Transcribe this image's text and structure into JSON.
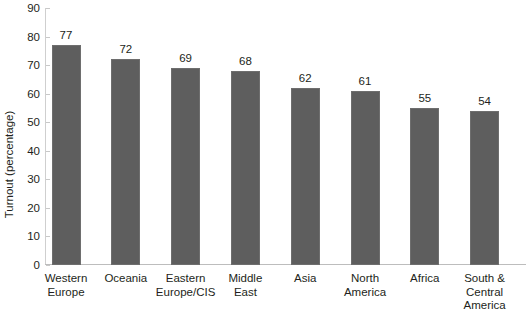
{
  "chart_data": {
    "type": "bar",
    "title": "",
    "xlabel": "",
    "ylabel": "Turnout (percentage)",
    "ylim": [
      0,
      90
    ],
    "ytick_step": 10,
    "yticks": [
      0,
      10,
      20,
      30,
      40,
      50,
      60,
      70,
      80,
      90
    ],
    "grid": false,
    "legend": "none",
    "orientation": "vertical",
    "bar_color": "#5e5e5e",
    "text_color": "#231f20",
    "axis_color": "#c8c8c8",
    "categories": [
      "Western Europe",
      "Oceania",
      "Eastern Europe/CIS",
      "Middle East",
      "Asia",
      "North America",
      "Africa",
      "South & Central America"
    ],
    "category_lines": [
      [
        "Western",
        "Europe"
      ],
      [
        "Oceania"
      ],
      [
        "Eastern",
        "Europe/CIS"
      ],
      [
        "Middle East"
      ],
      [
        "Asia"
      ],
      [
        "North",
        "America"
      ],
      [
        "Africa"
      ],
      [
        "South &",
        "Central",
        "America"
      ]
    ],
    "values": [
      77,
      72,
      69,
      68,
      62,
      61,
      55,
      54
    ],
    "value_labels": [
      "77",
      "72",
      "69",
      "68",
      "62",
      "61",
      "55",
      "54"
    ],
    "ytick_labels": [
      "0",
      "10",
      "20",
      "30",
      "40",
      "50",
      "60",
      "70",
      "80",
      "90"
    ]
  }
}
